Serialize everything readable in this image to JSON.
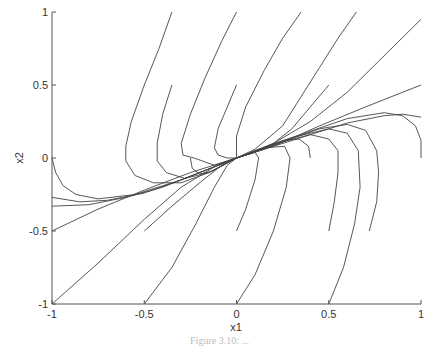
{
  "chart_data": {
    "type": "line",
    "title": "",
    "xlabel": "x1",
    "ylabel": "x2",
    "xlim": [
      -1,
      1
    ],
    "ylim": [
      -1,
      1
    ],
    "xticks": [
      -1,
      -0.5,
      0,
      0.5,
      1
    ],
    "yticks": [
      -1,
      -0.5,
      0,
      0.5,
      1
    ],
    "xtick_labels": [
      "-1",
      "-0.5",
      "0",
      "0.5",
      "1"
    ],
    "ytick_labels": [
      "-1",
      "-0.5",
      "0",
      "0.5",
      "1"
    ],
    "grid": false,
    "legend": null,
    "line_color": "#444444",
    "series": [
      {
        "name": "traj-1",
        "points": [
          [
            -0.35,
            1
          ],
          [
            -0.42,
            0.75
          ],
          [
            -0.5,
            0.5
          ],
          [
            -0.57,
            0.25
          ],
          [
            -0.6,
            0.08
          ],
          [
            -0.6,
            -0.02
          ],
          [
            -0.55,
            -0.12
          ],
          [
            -0.45,
            -0.17
          ],
          [
            -0.3,
            -0.17
          ],
          [
            -0.15,
            -0.1
          ],
          [
            0,
            0
          ]
        ]
      },
      {
        "name": "traj-2",
        "points": [
          [
            -0.35,
            0.5
          ],
          [
            -0.4,
            0.3
          ],
          [
            -0.43,
            0.1
          ],
          [
            -0.43,
            -0.02
          ],
          [
            -0.38,
            -0.1
          ],
          [
            -0.28,
            -0.14
          ],
          [
            -0.15,
            -0.1
          ],
          [
            0,
            0
          ]
        ]
      },
      {
        "name": "traj-3",
        "points": [
          [
            -0.25,
            0
          ],
          [
            -0.24,
            -0.07
          ],
          [
            -0.2,
            -0.11
          ],
          [
            -0.13,
            -0.09
          ],
          [
            0,
            0
          ]
        ]
      },
      {
        "name": "traj-4",
        "points": [
          [
            0,
            1
          ],
          [
            -0.08,
            0.8
          ],
          [
            -0.17,
            0.55
          ],
          [
            -0.25,
            0.3
          ],
          [
            -0.3,
            0.1
          ],
          [
            -0.29,
            0.02
          ],
          [
            -0.23,
            0
          ],
          [
            -0.12,
            -0.05
          ],
          [
            0,
            0
          ]
        ]
      },
      {
        "name": "traj-5",
        "points": [
          [
            0,
            0.5
          ],
          [
            -0.05,
            0.35
          ],
          [
            -0.1,
            0.2
          ],
          [
            -0.12,
            0.07
          ],
          [
            -0.1,
            0.02
          ],
          [
            -0.05,
            0
          ],
          [
            0,
            0
          ]
        ]
      },
      {
        "name": "traj-6",
        "points": [
          [
            0.35,
            1
          ],
          [
            0.25,
            0.82
          ],
          [
            0.15,
            0.6
          ],
          [
            0.05,
            0.35
          ],
          [
            0,
            0.15
          ],
          [
            0,
            0
          ]
        ]
      },
      {
        "name": "traj-7",
        "points": [
          [
            0.65,
            1
          ],
          [
            0.55,
            0.82
          ],
          [
            0.45,
            0.62
          ],
          [
            0.35,
            0.42
          ],
          [
            0.25,
            0.22
          ],
          [
            0.1,
            0.06
          ],
          [
            0,
            0
          ]
        ]
      },
      {
        "name": "traj-8",
        "points": [
          [
            0.5,
            0.5
          ],
          [
            0.4,
            0.35
          ],
          [
            0.3,
            0.2
          ],
          [
            0.2,
            0.1
          ],
          [
            0.1,
            0.04
          ],
          [
            0,
            0
          ]
        ]
      },
      {
        "name": "traj-9",
        "points": [
          [
            1,
            0.95
          ],
          [
            0.8,
            0.7
          ],
          [
            0.6,
            0.45
          ],
          [
            0.4,
            0.25
          ],
          [
            0.2,
            0.1
          ],
          [
            0,
            0
          ]
        ]
      },
      {
        "name": "traj-10",
        "points": [
          [
            1,
            0.5
          ],
          [
            0.7,
            0.35
          ],
          [
            0.45,
            0.22
          ],
          [
            0.2,
            0.08
          ],
          [
            0,
            0
          ]
        ]
      },
      {
        "name": "traj-11",
        "points": [
          [
            1,
            0
          ],
          [
            1,
            0.12
          ],
          [
            0.97,
            0.22
          ],
          [
            0.9,
            0.29
          ],
          [
            0.8,
            0.31
          ],
          [
            0.6,
            0.27
          ],
          [
            0.3,
            0.14
          ],
          [
            0,
            0
          ]
        ]
      },
      {
        "name": "traj-12",
        "points": [
          [
            0.72,
            -0.5
          ],
          [
            0.76,
            -0.3
          ],
          [
            0.77,
            -0.1
          ],
          [
            0.76,
            0.05
          ],
          [
            0.7,
            0.19
          ],
          [
            0.6,
            0.23
          ],
          [
            0.45,
            0.2
          ],
          [
            0.25,
            0.11
          ],
          [
            0,
            0
          ]
        ]
      },
      {
        "name": "traj-13",
        "points": [
          [
            0.5,
            -1
          ],
          [
            0.58,
            -0.75
          ],
          [
            0.64,
            -0.45
          ],
          [
            0.67,
            -0.2
          ],
          [
            0.66,
            0.05
          ],
          [
            0.6,
            0.17
          ],
          [
            0.5,
            0.2
          ],
          [
            0.3,
            0.14
          ],
          [
            0,
            0
          ]
        ]
      },
      {
        "name": "traj-14",
        "points": [
          [
            0.5,
            -0.5
          ],
          [
            0.53,
            -0.3
          ],
          [
            0.55,
            -0.1
          ],
          [
            0.55,
            0.05
          ],
          [
            0.5,
            0.13
          ],
          [
            0.4,
            0.16
          ],
          [
            0.25,
            0.11
          ],
          [
            0,
            0
          ]
        ]
      },
      {
        "name": "traj-15",
        "points": [
          [
            0.4,
            0
          ],
          [
            0.39,
            0.08
          ],
          [
            0.34,
            0.13
          ],
          [
            0.25,
            0.12
          ],
          [
            0.1,
            0.05
          ],
          [
            0,
            0
          ]
        ]
      },
      {
        "name": "traj-16",
        "points": [
          [
            0,
            -1
          ],
          [
            0.1,
            -0.8
          ],
          [
            0.2,
            -0.5
          ],
          [
            0.27,
            -0.2
          ],
          [
            0.29,
            0
          ],
          [
            0.26,
            0.08
          ],
          [
            0.15,
            0.07
          ],
          [
            0,
            0
          ]
        ]
      },
      {
        "name": "traj-17",
        "points": [
          [
            0,
            -0.5
          ],
          [
            0.05,
            -0.35
          ],
          [
            0.1,
            -0.15
          ],
          [
            0.12,
            0
          ],
          [
            0.1,
            0.04
          ],
          [
            0,
            0
          ]
        ]
      },
      {
        "name": "traj-18",
        "points": [
          [
            -0.5,
            -1
          ],
          [
            -0.35,
            -0.75
          ],
          [
            -0.22,
            -0.45
          ],
          [
            -0.12,
            -0.2
          ],
          [
            -0.05,
            -0.05
          ],
          [
            0,
            0
          ]
        ]
      },
      {
        "name": "traj-19",
        "points": [
          [
            -0.5,
            -0.5
          ],
          [
            -0.35,
            -0.33
          ],
          [
            -0.2,
            -0.17
          ],
          [
            -0.08,
            -0.05
          ],
          [
            0,
            0
          ]
        ]
      },
      {
        "name": "traj-20",
        "points": [
          [
            -1,
            -1
          ],
          [
            -0.75,
            -0.72
          ],
          [
            -0.5,
            -0.42
          ],
          [
            -0.3,
            -0.2
          ],
          [
            -0.12,
            -0.06
          ],
          [
            0,
            0
          ]
        ]
      },
      {
        "name": "traj-21",
        "points": [
          [
            -1,
            -0.5
          ],
          [
            -0.75,
            -0.35
          ],
          [
            -0.5,
            -0.22
          ],
          [
            -0.25,
            -0.1
          ],
          [
            0,
            0
          ]
        ]
      },
      {
        "name": "traj-22",
        "points": [
          [
            -1,
            -0.33
          ],
          [
            -0.8,
            -0.32
          ],
          [
            -0.6,
            -0.27
          ],
          [
            -0.4,
            -0.2
          ],
          [
            -0.2,
            -0.1
          ],
          [
            0,
            0
          ]
        ]
      },
      {
        "name": "traj-23",
        "points": [
          [
            -1,
            -0.27
          ],
          [
            -0.85,
            -0.3
          ],
          [
            -0.7,
            -0.29
          ],
          [
            -0.5,
            -0.24
          ],
          [
            -0.3,
            -0.15
          ],
          [
            0,
            0
          ]
        ]
      },
      {
        "name": "traj-24",
        "points": [
          [
            -1,
            0
          ],
          [
            -0.98,
            -0.1
          ],
          [
            -0.94,
            -0.19
          ],
          [
            -0.87,
            -0.25
          ],
          [
            -0.75,
            -0.28
          ],
          [
            -0.55,
            -0.25
          ],
          [
            -0.3,
            -0.15
          ],
          [
            0,
            0
          ]
        ]
      },
      {
        "name": "traj-25",
        "points": [
          [
            0,
            0
          ],
          [
            0.3,
            0.12
          ],
          [
            0.6,
            0.24
          ],
          [
            0.8,
            0.29
          ],
          [
            0.9,
            0.3
          ],
          [
            1,
            0.28
          ]
        ]
      }
    ]
  },
  "caption": "Figure 3.10: ..."
}
